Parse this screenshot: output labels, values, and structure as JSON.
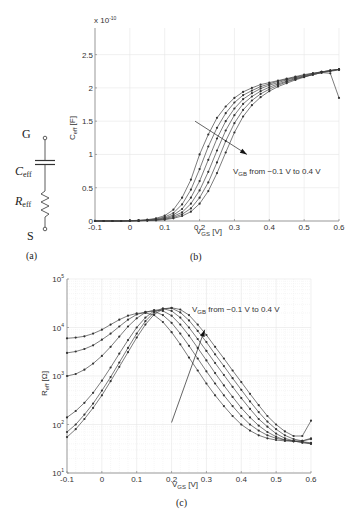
{
  "figure": {
    "panel_labels": {
      "a": "(a)",
      "b": "(b)",
      "c": "(c)"
    },
    "circuit": {
      "terminal_top": "G",
      "terminal_bottom": "S",
      "capacitor_label_main": "C",
      "capacitor_label_sub": "eff",
      "resistor_label_main": "R",
      "resistor_label_sub": "eff"
    }
  },
  "chart_data": [
    {
      "id": "b",
      "type": "line",
      "title": "",
      "xlabel": "V_GS [V]",
      "xlabel_main": "V",
      "xlabel_sub": "GS",
      "xlabel_unit": " [V]",
      "ylabel": "C_eff [F]",
      "ylabel_main": "C",
      "ylabel_sub": "eff",
      "ylabel_unit": " [F]",
      "y_multiplier": "x 10",
      "y_multiplier_exp": "-10",
      "xlim": [
        -0.1,
        0.6
      ],
      "ylim": [
        0,
        2.9
      ],
      "xticks": [
        -0.1,
        0,
        0.1,
        0.2,
        0.3,
        0.4,
        0.5,
        0.6
      ],
      "xtick_labels": [
        "-0.1",
        "0",
        "0.1",
        "0.2",
        "0.3",
        "0.4",
        "0.5",
        "0.6"
      ],
      "yticks": [
        0,
        0.5,
        1,
        1.5,
        2,
        2.5
      ],
      "ytick_labels": [
        "0",
        "0.5",
        "1",
        "1.5",
        "2",
        "2.5"
      ],
      "grid": true,
      "annotation": {
        "main": "V",
        "sub": "GB",
        "rest": " from −0.1 V to 0.4 V"
      },
      "arrow": {
        "from": [
          0.187,
          1.5
        ],
        "to": [
          0.336,
          1.0
        ]
      },
      "x": [
        -0.1,
        -0.075,
        -0.05,
        -0.025,
        0,
        0.025,
        0.05,
        0.075,
        0.1,
        0.125,
        0.15,
        0.175,
        0.2,
        0.225,
        0.25,
        0.275,
        0.3,
        0.325,
        0.35,
        0.375,
        0.4,
        0.425,
        0.45,
        0.475,
        0.5,
        0.525,
        0.55,
        0.575,
        0.6
      ],
      "series": [
        {
          "name": "V_GB = -0.1 V",
          "values": [
            0,
            0,
            0,
            0,
            0.005,
            0.01,
            0.02,
            0.04,
            0.08,
            0.17,
            0.35,
            0.62,
            1.0,
            1.3,
            1.55,
            1.72,
            1.85,
            1.94,
            2.0,
            2.05,
            2.08,
            2.11,
            2.14,
            2.17,
            2.2,
            2.22,
            2.24,
            2.26,
            2.28
          ]
        },
        {
          "name": "V_GB = 0 V",
          "values": [
            0,
            0,
            0,
            0,
            0.004,
            0.008,
            0.015,
            0.03,
            0.06,
            0.12,
            0.25,
            0.47,
            0.78,
            1.12,
            1.4,
            1.62,
            1.78,
            1.89,
            1.96,
            2.02,
            2.06,
            2.1,
            2.13,
            2.16,
            2.19,
            2.22,
            2.24,
            2.26,
            2.28
          ]
        },
        {
          "name": "V_GB = 0.1 V",
          "values": [
            0,
            0,
            0,
            0,
            0.003,
            0.006,
            0.012,
            0.022,
            0.045,
            0.09,
            0.18,
            0.35,
            0.6,
            0.92,
            1.24,
            1.5,
            1.69,
            1.83,
            1.92,
            1.99,
            2.04,
            2.08,
            2.12,
            2.15,
            2.18,
            2.21,
            2.24,
            2.26,
            2.28
          ]
        },
        {
          "name": "V_GB = 0.2 V",
          "values": [
            0,
            0,
            0,
            0,
            0.002,
            0.005,
            0.01,
            0.018,
            0.035,
            0.07,
            0.13,
            0.26,
            0.46,
            0.74,
            1.06,
            1.36,
            1.59,
            1.76,
            1.87,
            1.95,
            2.01,
            2.06,
            2.1,
            2.14,
            2.17,
            2.2,
            2.23,
            2.26,
            2.28
          ]
        },
        {
          "name": "V_GB = 0.3 V",
          "values": [
            0,
            0,
            0,
            0,
            0.002,
            0.004,
            0.008,
            0.014,
            0.027,
            0.052,
            0.1,
            0.19,
            0.35,
            0.58,
            0.88,
            1.2,
            1.47,
            1.67,
            1.81,
            1.91,
            1.98,
            2.04,
            2.09,
            2.13,
            2.17,
            2.2,
            2.23,
            2.25,
            2.27
          ]
        },
        {
          "name": "V_GB = 0.4 V",
          "values": [
            0,
            0,
            0,
            0,
            0.001,
            0.003,
            0.006,
            0.011,
            0.02,
            0.04,
            0.075,
            0.14,
            0.26,
            0.45,
            0.72,
            1.03,
            1.33,
            1.57,
            1.74,
            1.86,
            1.95,
            2.02,
            2.07,
            2.12,
            2.16,
            2.2,
            2.23,
            2.22,
            1.85
          ]
        }
      ]
    },
    {
      "id": "c",
      "type": "line",
      "title": "",
      "xlabel": "V_GS [V]",
      "xlabel_main": "V",
      "xlabel_sub": "GS",
      "xlabel_unit": " [V]",
      "ylabel": "R_eff [Ω]",
      "ylabel_main": "R",
      "ylabel_sub": "eff",
      "ylabel_unit": " [Ω]",
      "yscale": "log",
      "xlim": [
        -0.1,
        0.6
      ],
      "ylim": [
        10,
        100000
      ],
      "xticks": [
        -0.1,
        0,
        0.1,
        0.2,
        0.3,
        0.4,
        0.5,
        0.6
      ],
      "xtick_labels": [
        "-0.1",
        "0",
        "0.1",
        "0.2",
        "0.3",
        "0.4",
        "0.5",
        "0.6"
      ],
      "yticks": [
        10,
        100,
        1000,
        10000,
        100000
      ],
      "ytick_exponents": [
        "1",
        "2",
        "3",
        "4",
        "5"
      ],
      "grid": true,
      "annotation": {
        "main": "V",
        "sub": "GB",
        "rest": " from −0.1 V to 0.4 V"
      },
      "arrow": {
        "from": [
          0.2,
          110
        ],
        "to": [
          0.295,
          9000
        ]
      },
      "x": [
        -0.1,
        -0.075,
        -0.05,
        -0.025,
        0,
        0.025,
        0.05,
        0.075,
        0.1,
        0.125,
        0.15,
        0.175,
        0.2,
        0.225,
        0.25,
        0.275,
        0.3,
        0.325,
        0.35,
        0.375,
        0.4,
        0.425,
        0.45,
        0.475,
        0.5,
        0.525,
        0.55,
        0.575,
        0.6
      ],
      "series": [
        {
          "name": "V_GB = -0.1 V",
          "values": [
            6000,
            6200,
            6600,
            7500,
            9000,
            11500,
            14500,
            17500,
            19500,
            20000,
            18000,
            13000,
            8000,
            4500,
            2400,
            1300,
            700,
            400,
            240,
            150,
            100,
            75,
            60,
            52,
            48,
            46,
            45,
            44,
            42
          ]
        },
        {
          "name": "V_GB = 0 V",
          "values": [
            3000,
            3200,
            3600,
            4300,
            5600,
            7500,
            10500,
            14500,
            18500,
            21000,
            21500,
            18000,
            12500,
            7500,
            4200,
            2300,
            1250,
            700,
            400,
            240,
            150,
            100,
            75,
            60,
            52,
            48,
            46,
            46,
            50
          ]
        },
        {
          "name": "V_GB = 0.1 V",
          "values": [
            1000,
            1100,
            1350,
            1800,
            2600,
            4000,
            6500,
            10500,
            15500,
            20500,
            23000,
            22000,
            17500,
            11500,
            6800,
            3800,
            2100,
            1150,
            640,
            370,
            220,
            140,
            95,
            70,
            56,
            48,
            45,
            44,
            40
          ]
        },
        {
          "name": "V_GB = 0.2 V",
          "values": [
            140,
            190,
            280,
            450,
            800,
            1500,
            2900,
            5500,
            10000,
            16000,
            22000,
            24500,
            22000,
            16000,
            10000,
            5800,
            3300,
            1850,
            1050,
            600,
            350,
            210,
            130,
            90,
            65,
            52,
            46,
            42,
            40
          ]
        },
        {
          "name": "V_GB = 0.3 V",
          "values": [
            70,
            100,
            160,
            270,
            500,
            950,
            1900,
            3800,
            7500,
            13500,
            20500,
            24500,
            25000,
            20500,
            14000,
            8500,
            5000,
            2800,
            1600,
            900,
            520,
            300,
            180,
            115,
            80,
            60,
            50,
            46,
            52
          ]
        },
        {
          "name": "V_GB = 0.4 V",
          "values": [
            55,
            80,
            130,
            220,
            400,
            780,
            1550,
            3100,
            6200,
            11500,
            18500,
            24000,
            25500,
            23500,
            18000,
            11500,
            7000,
            4000,
            2300,
            1300,
            750,
            430,
            250,
            150,
            100,
            72,
            58,
            58,
            120
          ]
        }
      ]
    }
  ]
}
